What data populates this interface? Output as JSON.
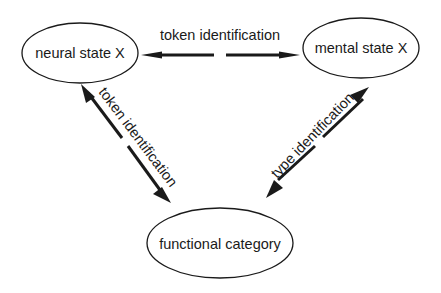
{
  "diagram": {
    "nodes": [
      {
        "id": "neural",
        "label": "neural state X"
      },
      {
        "id": "mental",
        "label": "mental state X"
      },
      {
        "id": "functional",
        "label": "functional category"
      }
    ],
    "edges": [
      {
        "from": "neural",
        "to": "mental",
        "label": "token identification",
        "bidirectional": true
      },
      {
        "from": "neural",
        "to": "functional",
        "label": "token identification",
        "bidirectional": true
      },
      {
        "from": "mental",
        "to": "functional",
        "label": "type identification",
        "bidirectional": true
      }
    ],
    "colors": {
      "ink": "#1a1a1a",
      "background": "#ffffff"
    }
  }
}
